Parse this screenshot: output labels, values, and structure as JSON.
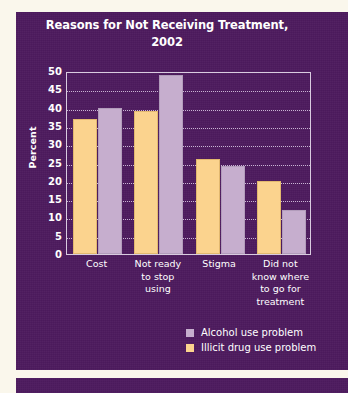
{
  "document": {
    "page_background": "#FAF7EC",
    "panel_background": "#4D1A5E"
  },
  "chart_data": {
    "type": "bar",
    "title": "Reasons for Not Receiving Treatment, 2002",
    "title_line1": "Reasons for Not Receiving Treatment,",
    "title_line2": "2002",
    "xlabel": "",
    "ylabel": "Percent",
    "ylim": [
      0,
      50
    ],
    "ytick_step": 5,
    "grid": true,
    "grid_style": "dotted-horizontal",
    "legend_position": "bottom-right",
    "categories": [
      "Cost",
      "Not ready to stop using",
      "Stigma",
      "Did not know where to go for treatment"
    ],
    "category_lines": [
      [
        "Cost"
      ],
      [
        "Not ready",
        "to stop",
        "using"
      ],
      [
        "Stigma"
      ],
      [
        "Did not",
        "know where",
        "to go for",
        "treatment"
      ]
    ],
    "yticks": [
      "50",
      "45",
      "40",
      "35",
      "30",
      "25",
      "20",
      "15",
      "10",
      "5",
      "0"
    ],
    "series": [
      {
        "name": "Illicit drug use problem",
        "key": "illicit",
        "color": "#FBD38E",
        "values": [
          37,
          39,
          26,
          20
        ]
      },
      {
        "name": "Alcohol use problem",
        "key": "alcohol",
        "color": "#C6AECE",
        "values": [
          40,
          49,
          24,
          12
        ]
      }
    ],
    "legend": [
      {
        "label": "Alcohol use problem",
        "color": "#C6AECE",
        "key": "alcohol"
      },
      {
        "label": "Illicit drug use problem",
        "color": "#FBD38E",
        "key": "illicit"
      }
    ]
  }
}
